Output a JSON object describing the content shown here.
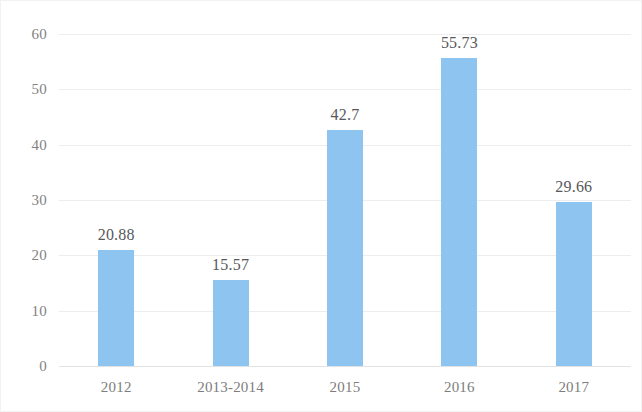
{
  "chart_data": {
    "type": "bar",
    "title": "",
    "subtitle": "",
    "xlabel": "",
    "ylabel": "",
    "categories": [
      "2012",
      "2013-2014",
      "2015",
      "2016",
      "2017"
    ],
    "values": [
      20.88,
      15.57,
      42.7,
      55.73,
      29.66
    ],
    "value_labels": [
      "20.88",
      "15.57",
      "42.7",
      "55.73",
      "29.66"
    ],
    "ylim": [
      0,
      60
    ],
    "ytick_labels": [
      "0",
      "10",
      "20",
      "30",
      "40",
      "50",
      "60"
    ],
    "ytick_values": [
      0,
      10,
      20,
      30,
      40,
      50,
      60
    ],
    "grid": true,
    "grid_axis": "y",
    "legend": false,
    "legend_position": "none",
    "series": [
      {
        "name": "",
        "values": [
          20.88,
          15.57,
          42.7,
          55.73,
          29.66
        ],
        "color": "#8ec4f0"
      }
    ]
  },
  "colors": {
    "bar": "#8ec4f0",
    "gridline": "#ededed",
    "baseline": "#e2e2e2",
    "tick_text": "#828282",
    "value_text": "#58585a",
    "category_text": "#7d7d7d",
    "background": "#ffffff"
  }
}
